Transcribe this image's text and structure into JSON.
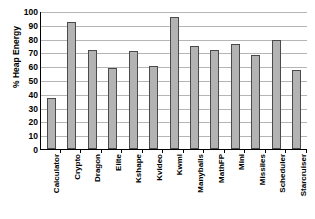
{
  "chart_data": {
    "type": "bar",
    "title": "",
    "xlabel": "",
    "ylabel": "% Heap Energy",
    "ylim": [
      0,
      100
    ],
    "ytick_step": 10,
    "yticks": [
      100,
      90,
      80,
      70,
      60,
      50,
      40,
      30,
      20,
      10,
      0
    ],
    "grid": true,
    "legend": "none",
    "bar_color": "#b3b3b3",
    "bar_border_color": "#4a4a4a",
    "gridline_color": "#b5b5b5",
    "axis_color": "#000000",
    "background": "#ffffff",
    "categories": [
      "Calculator",
      "Crypto",
      "Dragon",
      "Elite",
      "Kshape",
      "Kvideo",
      "Kwml",
      "Manyballs",
      "MathFP",
      "Mini",
      "Missiles",
      "Scheduler",
      "Starcruiser"
    ],
    "values": [
      37,
      92,
      71.5,
      59,
      71,
      60,
      96,
      74.5,
      72,
      76,
      68,
      79,
      57.5
    ]
  }
}
